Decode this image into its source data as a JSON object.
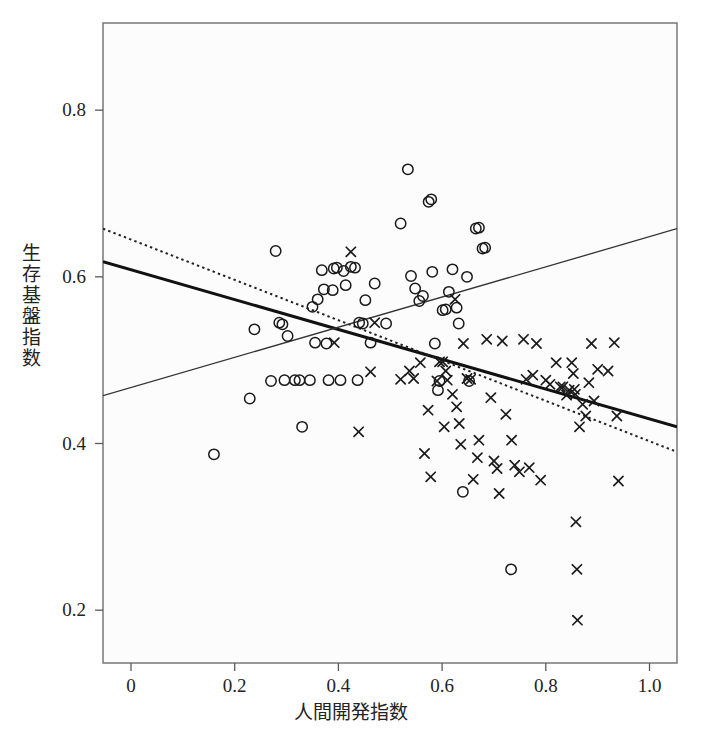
{
  "figure": {
    "background_color": "#ffffff",
    "frame_color": "#6e6e6e",
    "plot_fill": "#fcfcfc"
  },
  "axes": {
    "x_title": "人間開発指数",
    "y_title": "生存基盤指数",
    "x_ticks": [
      "0",
      "0.2",
      "0.4",
      "0.6",
      "0.8",
      "1.0"
    ],
    "x_tick_values": [
      0,
      0.2,
      0.4,
      0.6,
      0.8,
      1.0
    ],
    "y_ticks": [
      "0.2",
      "0.4",
      "0.6",
      "0.8"
    ],
    "y_tick_values": [
      0.2,
      0.4,
      0.6,
      0.8
    ]
  },
  "chart_data": {
    "type": "scatter",
    "title": "",
    "subtitle": "",
    "xlabel": "人間開発指数",
    "ylabel": "生存基盤指数",
    "xlim": [
      -0.054,
      1.053
    ],
    "ylim": [
      0.1366,
      0.9046
    ],
    "grid": false,
    "legend": "none",
    "series": [
      {
        "name": "circle-markers",
        "marker": "circle",
        "color": "#1a1a1a",
        "points": [
          [
            0.16,
            0.387
          ],
          [
            0.229,
            0.454
          ],
          [
            0.238,
            0.537
          ],
          [
            0.27,
            0.475
          ],
          [
            0.279,
            0.631
          ],
          [
            0.286,
            0.545
          ],
          [
            0.292,
            0.543
          ],
          [
            0.296,
            0.476
          ],
          [
            0.302,
            0.529
          ],
          [
            0.316,
            0.476
          ],
          [
            0.325,
            0.476
          ],
          [
            0.33,
            0.42
          ],
          [
            0.345,
            0.476
          ],
          [
            0.35,
            0.564
          ],
          [
            0.355,
            0.521
          ],
          [
            0.36,
            0.573
          ],
          [
            0.368,
            0.608
          ],
          [
            0.372,
            0.585
          ],
          [
            0.377,
            0.52
          ],
          [
            0.381,
            0.476
          ],
          [
            0.389,
            0.584
          ],
          [
            0.391,
            0.61
          ],
          [
            0.397,
            0.611
          ],
          [
            0.404,
            0.476
          ],
          [
            0.41,
            0.607
          ],
          [
            0.414,
            0.59
          ],
          [
            0.424,
            0.612
          ],
          [
            0.432,
            0.611
          ],
          [
            0.437,
            0.476
          ],
          [
            0.44,
            0.545
          ],
          [
            0.447,
            0.544
          ],
          [
            0.452,
            0.572
          ],
          [
            0.462,
            0.521
          ],
          [
            0.47,
            0.592
          ],
          [
            0.492,
            0.544
          ],
          [
            0.52,
            0.664
          ],
          [
            0.534,
            0.729
          ],
          [
            0.54,
            0.601
          ],
          [
            0.548,
            0.586
          ],
          [
            0.556,
            0.571
          ],
          [
            0.563,
            0.577
          ],
          [
            0.574,
            0.69
          ],
          [
            0.579,
            0.693
          ],
          [
            0.581,
            0.606
          ],
          [
            0.586,
            0.52
          ],
          [
            0.592,
            0.464
          ],
          [
            0.595,
            0.475
          ],
          [
            0.601,
            0.56
          ],
          [
            0.607,
            0.561
          ],
          [
            0.613,
            0.582
          ],
          [
            0.62,
            0.609
          ],
          [
            0.628,
            0.563
          ],
          [
            0.632,
            0.544
          ],
          [
            0.64,
            0.342
          ],
          [
            0.648,
            0.6
          ],
          [
            0.652,
            0.475
          ],
          [
            0.665,
            0.658
          ],
          [
            0.671,
            0.659
          ],
          [
            0.678,
            0.634
          ],
          [
            0.683,
            0.635
          ],
          [
            0.733,
            0.249
          ]
        ]
      },
      {
        "name": "cross-markers",
        "marker": "cross",
        "color": "#1a1a1a",
        "points": [
          [
            0.392,
            0.521
          ],
          [
            0.424,
            0.63
          ],
          [
            0.439,
            0.414
          ],
          [
            0.462,
            0.486
          ],
          [
            0.47,
            0.545
          ],
          [
            0.52,
            0.477
          ],
          [
            0.537,
            0.487
          ],
          [
            0.545,
            0.478
          ],
          [
            0.558,
            0.497
          ],
          [
            0.566,
            0.388
          ],
          [
            0.573,
            0.44
          ],
          [
            0.578,
            0.36
          ],
          [
            0.59,
            0.475
          ],
          [
            0.595,
            0.498
          ],
          [
            0.601,
            0.498
          ],
          [
            0.604,
            0.42
          ],
          [
            0.607,
            0.487
          ],
          [
            0.61,
            0.476
          ],
          [
            0.62,
            0.459
          ],
          [
            0.625,
            0.573
          ],
          [
            0.628,
            0.444
          ],
          [
            0.633,
            0.424
          ],
          [
            0.636,
            0.399
          ],
          [
            0.641,
            0.52
          ],
          [
            0.648,
            0.478
          ],
          [
            0.655,
            0.477
          ],
          [
            0.66,
            0.357
          ],
          [
            0.668,
            0.383
          ],
          [
            0.671,
            0.404
          ],
          [
            0.686,
            0.525
          ],
          [
            0.694,
            0.455
          ],
          [
            0.7,
            0.379
          ],
          [
            0.706,
            0.37
          ],
          [
            0.71,
            0.34
          ],
          [
            0.716,
            0.523
          ],
          [
            0.723,
            0.435
          ],
          [
            0.734,
            0.404
          ],
          [
            0.74,
            0.374
          ],
          [
            0.749,
            0.366
          ],
          [
            0.757,
            0.525
          ],
          [
            0.762,
            0.477
          ],
          [
            0.768,
            0.371
          ],
          [
            0.775,
            0.482
          ],
          [
            0.782,
            0.52
          ],
          [
            0.79,
            0.356
          ],
          [
            0.8,
            0.476
          ],
          [
            0.808,
            0.471
          ],
          [
            0.82,
            0.497
          ],
          [
            0.828,
            0.468
          ],
          [
            0.833,
            0.468
          ],
          [
            0.84,
            0.458
          ],
          [
            0.845,
            0.464
          ],
          [
            0.85,
            0.497
          ],
          [
            0.853,
            0.484
          ],
          [
            0.855,
            0.465
          ],
          [
            0.857,
            0.459
          ],
          [
            0.858,
            0.306
          ],
          [
            0.86,
            0.249
          ],
          [
            0.861,
            0.188
          ],
          [
            0.865,
            0.42
          ],
          [
            0.871,
            0.447
          ],
          [
            0.877,
            0.433
          ],
          [
            0.883,
            0.473
          ],
          [
            0.888,
            0.52
          ],
          [
            0.893,
            0.451
          ],
          [
            0.9,
            0.489
          ],
          [
            0.92,
            0.487
          ],
          [
            0.932,
            0.521
          ],
          [
            0.937,
            0.433
          ],
          [
            0.94,
            0.355
          ]
        ]
      }
    ],
    "lines": [
      {
        "name": "thick-regression-line",
        "style": "solid",
        "width": 3,
        "color": "#111111",
        "x": [
          -0.054,
          1.053
        ],
        "y": [
          0.6182,
          0.4199
        ]
      },
      {
        "name": "dotted-regression-line",
        "style": "dotted",
        "width": 2,
        "color": "#222222",
        "x": [
          -0.054,
          1.053
        ],
        "y": [
          0.6578,
          0.3899
        ]
      },
      {
        "name": "thin-rising-line",
        "style": "solid",
        "width": 1.3,
        "color": "#333333",
        "x": [
          -0.054,
          1.053
        ],
        "y": [
          0.4574,
          0.6578
        ]
      }
    ]
  }
}
